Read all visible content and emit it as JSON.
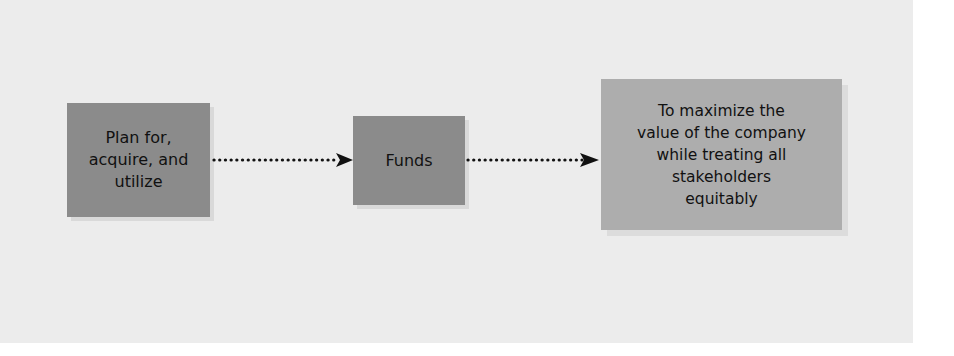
{
  "diagram": {
    "type": "flow",
    "direction": "left-to-right",
    "nodes": [
      {
        "id": "plan",
        "label": "Plan for,\nacquire, and\nutilize",
        "fill": "#8b8b8b"
      },
      {
        "id": "funds",
        "label": "Funds",
        "fill": "#8b8b8b"
      },
      {
        "id": "goal",
        "label": "To maximize the\nvalue of the company\nwhile treating all\nstakeholders\nequitably",
        "fill": "#adadad"
      }
    ],
    "edges": [
      {
        "from": "plan",
        "to": "funds",
        "style": "dotted-arrow"
      },
      {
        "from": "funds",
        "to": "goal",
        "style": "dotted-arrow"
      }
    ],
    "colors": {
      "background_panel": "#ececec",
      "page": "#ffffff",
      "arrow": "#111111",
      "text": "#111111"
    }
  }
}
